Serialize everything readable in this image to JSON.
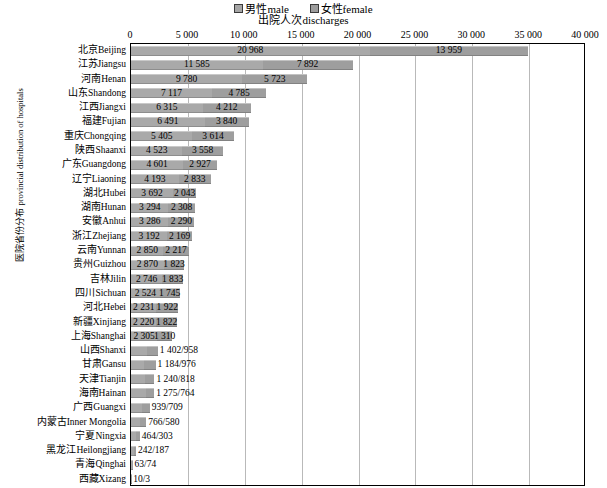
{
  "legend": {
    "items": [
      {
        "label": "男性male",
        "swatch": "male-swatch-icon"
      },
      {
        "label": "女性female",
        "swatch": "female-swatch-icon"
      }
    ]
  },
  "axis": {
    "title": "出院人次discharges",
    "y_title_cn": "医院省份分布",
    "y_title_en": "provincial distribution of hospitals",
    "ticks": [
      "0",
      "5 000",
      "10 000",
      "15 000",
      "20 000",
      "25 000",
      "30 000",
      "35 000",
      "40 000"
    ]
  },
  "chart_data": {
    "type": "bar",
    "orientation": "horizontal",
    "stacked": true,
    "title": "出院人次discharges",
    "xlabel": "出院人次discharges",
    "ylabel": "医院省份分布 provincial distribution of hospitals",
    "xlim": [
      0,
      40000
    ],
    "xticks": [
      0,
      5000,
      10000,
      15000,
      20000,
      25000,
      30000,
      35000,
      40000
    ],
    "grid": true,
    "legend_position": "top-center",
    "series": [
      {
        "name": "男性male",
        "color": "#a9a9a9"
      },
      {
        "name": "女性female",
        "color": "#9e9e9e"
      }
    ],
    "categories": [
      "北京Beijing",
      "江苏Jiangsu",
      "河南Henan",
      "山东Shandong",
      "江西Jiangxi",
      "福建Fujian",
      "重庆Chongqing",
      "陕西Shaanxi",
      "广东Guangdong",
      "辽宁Liaoning",
      "湖北Hubei",
      "湖南Hunan",
      "安徽Anhui",
      "浙江Zhejiang",
      "云南Yunnan",
      "贵州Guizhou",
      "吉林Jilin",
      "四川Sichuan",
      "河北Hebei",
      "新疆Xinjiang",
      "上海Shanghai",
      "山西Shanxi",
      "甘肃Gansu",
      "天津Tianjin",
      "海南Hainan",
      "广西Guangxi",
      "内蒙古Inner Mongolia",
      "宁夏Ningxia",
      "黑龙江Heilongjiang",
      "青海Qinghai",
      "西藏Xizang"
    ],
    "rows": [
      {
        "name": "北京Beijing",
        "cn": "北京",
        "en": "Beijing",
        "male": 20968,
        "female": 13959,
        "male_label": "20 968",
        "female_label": "13 959",
        "label_mode": "inner"
      },
      {
        "name": "江苏Jiangsu",
        "cn": "江苏",
        "en": "Jiangsu",
        "male": 11585,
        "female": 7892,
        "male_label": "11 585",
        "female_label": "7 892",
        "label_mode": "inner"
      },
      {
        "name": "河南Henan",
        "cn": "河南",
        "en": "Henan",
        "male": 9780,
        "female": 5723,
        "male_label": "9 780",
        "female_label": "5 723",
        "label_mode": "inner"
      },
      {
        "name": "山东Shandong",
        "cn": "山东",
        "en": "Shandong",
        "male": 7117,
        "female": 4785,
        "male_label": "7 117",
        "female_label": "4 785",
        "label_mode": "inner"
      },
      {
        "name": "江西Jiangxi",
        "cn": "江西",
        "en": "Jiangxi",
        "male": 6315,
        "female": 4212,
        "male_label": "6 315",
        "female_label": "4 212",
        "label_mode": "inner"
      },
      {
        "name": "福建Fujian",
        "cn": "福建",
        "en": "Fujian",
        "male": 6491,
        "female": 3840,
        "male_label": "6 491",
        "female_label": "3 840",
        "label_mode": "inner"
      },
      {
        "name": "重庆Chongqing",
        "cn": "重庆",
        "en": "Chongqing",
        "male": 5405,
        "female": 3614,
        "male_label": "5 405",
        "female_label": "3 614",
        "label_mode": "inner"
      },
      {
        "name": "陕西Shaanxi",
        "cn": "陕西",
        "en": "Shaanxi",
        "male": 4523,
        "female": 3558,
        "male_label": "4 523",
        "female_label": "3 558",
        "label_mode": "inner"
      },
      {
        "name": "广东Guangdong",
        "cn": "广东",
        "en": "Guangdong",
        "male": 4601,
        "female": 2927,
        "male_label": "4 601",
        "female_label": "2 927",
        "label_mode": "inner"
      },
      {
        "name": "辽宁Liaoning",
        "cn": "辽宁",
        "en": "Liaoning",
        "male": 4193,
        "female": 2833,
        "male_label": "4 193",
        "female_label": "2 833",
        "label_mode": "inner"
      },
      {
        "name": "湖北Hubei",
        "cn": "湖北",
        "en": "Hubei",
        "male": 3692,
        "female": 2043,
        "male_label": "3 692",
        "female_label": "2 043",
        "label_mode": "inner"
      },
      {
        "name": "湖南Hunan",
        "cn": "湖南",
        "en": "Hunan",
        "male": 3294,
        "female": 2308,
        "male_label": "3 294",
        "female_label": "2 308",
        "label_mode": "inner"
      },
      {
        "name": "安徽Anhui",
        "cn": "安徽",
        "en": "Anhui",
        "male": 3286,
        "female": 2290,
        "male_label": "3 286",
        "female_label": "2 290",
        "label_mode": "inner"
      },
      {
        "name": "浙江Zhejiang",
        "cn": "浙江",
        "en": "Zhejiang",
        "male": 3192,
        "female": 2169,
        "male_label": "3 192",
        "female_label": "2 169",
        "label_mode": "inner"
      },
      {
        "name": "云南Yunnan",
        "cn": "云南",
        "en": "Yunnan",
        "male": 2850,
        "female": 2217,
        "male_label": "2 850",
        "female_label": "2 217",
        "label_mode": "inner"
      },
      {
        "name": "贵州Guizhou",
        "cn": "贵州",
        "en": "Guizhou",
        "male": 2870,
        "female": 1823,
        "male_label": "2 870",
        "female_label": "1 823",
        "label_mode": "inner"
      },
      {
        "name": "吉林Jilin",
        "cn": "吉林",
        "en": "Jilin",
        "male": 2746,
        "female": 1833,
        "male_label": "2 746",
        "female_label": "1 833",
        "label_mode": "inner"
      },
      {
        "name": "四川Sichuan",
        "cn": "四川",
        "en": "Sichuan",
        "male": 2524,
        "female": 1745,
        "male_label": "2 524",
        "female_label": "1 745",
        "label_mode": "inner"
      },
      {
        "name": "河北Hebei",
        "cn": "河北",
        "en": "Hebei",
        "male": 2231,
        "female": 1922,
        "male_label": "2 231",
        "female_label": "1 922",
        "label_mode": "inner"
      },
      {
        "name": "新疆Xinjiang",
        "cn": "新疆",
        "en": "Xinjiang",
        "male": 2220,
        "female": 1822,
        "male_label": "2 220",
        "female_label": "1 822",
        "label_mode": "inner"
      },
      {
        "name": "上海Shanghai",
        "cn": "上海",
        "en": "Shanghai",
        "male": 2305,
        "female": 1310,
        "male_label": "2 305",
        "female_label": "1 310",
        "label_mode": "inner"
      },
      {
        "name": "山西Shanxi",
        "cn": "山西",
        "en": "Shanxi",
        "male": 1402,
        "female": 958,
        "outer_label": "1 402/958",
        "label_mode": "outer"
      },
      {
        "name": "甘肃Gansu",
        "cn": "甘肃",
        "en": "Gansu",
        "male": 1184,
        "female": 976,
        "outer_label": "1 184/976",
        "label_mode": "outer"
      },
      {
        "name": "天津Tianjin",
        "cn": "天津",
        "en": "Tianjin",
        "male": 1240,
        "female": 818,
        "outer_label": "1 240/818",
        "label_mode": "outer"
      },
      {
        "name": "海南Hainan",
        "cn": "海南",
        "en": "Hainan",
        "male": 1275,
        "female": 764,
        "outer_label": "1 275/764",
        "label_mode": "outer"
      },
      {
        "name": "广西Guangxi",
        "cn": "广西",
        "en": "Guangxi",
        "male": 939,
        "female": 709,
        "outer_label": "939/709",
        "label_mode": "outer"
      },
      {
        "name": "内蒙古Inner Mongolia",
        "cn": "内蒙古",
        "en": "Inner Mongolia",
        "male": 766,
        "female": 580,
        "outer_label": "766/580",
        "label_mode": "outer"
      },
      {
        "name": "宁夏Ningxia",
        "cn": "宁夏",
        "en": "Ningxia",
        "male": 464,
        "female": 303,
        "outer_label": "464/303",
        "label_mode": "outer"
      },
      {
        "name": "黑龙江Heilongjiang",
        "cn": "黑龙江",
        "en": "Heilongjiang",
        "male": 242,
        "female": 187,
        "outer_label": "242/187",
        "label_mode": "outer"
      },
      {
        "name": "青海Qinghai",
        "cn": "青海",
        "en": "Qinghai",
        "male": 63,
        "female": 74,
        "outer_label": "63/74",
        "label_mode": "outer"
      },
      {
        "name": "西藏Xizang",
        "cn": "西藏",
        "en": "Xizang",
        "male": 10,
        "female": 3,
        "outer_label": "10/3",
        "label_mode": "outer"
      }
    ]
  }
}
